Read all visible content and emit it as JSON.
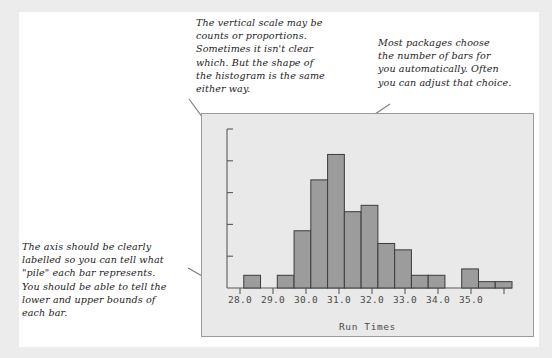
{
  "figure": {
    "background_color": "#ececed",
    "card_color": "#ffffff",
    "panel_color": "#e9e9e9"
  },
  "annotations": [
    {
      "name": "vertical-scale-note",
      "text": "The vertical scale may be\ncounts or proportions.\nSometimes it isn't clear\nwhich. But the shape of\nthe histogram is the same\neither way."
    },
    {
      "name": "number-of-bars-note",
      "text": "Most packages choose\nthe number of bars for\nyou automatically. Often\nyou can adjust that choice."
    },
    {
      "name": "axis-labelling-note",
      "text": "The axis should be clearly\nlabelled so you can tell what\n\"pile\" each bar represents.\nYou should be able to tell the\nlower and upper bounds of\neach bar."
    }
  ],
  "chart_data": {
    "type": "bar",
    "title": "",
    "xlabel": "Run Times",
    "ylabel": "",
    "xlim": [
      27.5,
      36.0
    ],
    "ylim": [
      0,
      25
    ],
    "grid": false,
    "legend": null,
    "bar_color": "#9c9c9c",
    "bar_edge_color": "#3c3c3c",
    "axis_color": "#5a5a5a",
    "xtick_labels": [
      "28.0",
      "29.0",
      "30.0",
      "31.0",
      "32.0",
      "33.0",
      "34.0",
      "35.0"
    ],
    "xtick_values": [
      28.0,
      29.0,
      30.0,
      31.0,
      32.0,
      33.0,
      34.0,
      35.0
    ],
    "ytick_values": [
      0,
      5,
      10,
      15,
      20,
      25
    ],
    "ytick_labels": [
      "",
      "",
      "",
      "",
      "",
      ""
    ],
    "bin_width": 0.5,
    "bin_edges": [
      27.5,
      28.0,
      28.5,
      29.0,
      29.5,
      30.0,
      30.5,
      31.0,
      31.5,
      32.0,
      32.5,
      33.0,
      33.5,
      34.0,
      34.5,
      35.0,
      35.5,
      36.0
    ],
    "categories": [
      "27.5",
      "28.0",
      "28.5",
      "29.0",
      "29.5",
      "30.0",
      "30.5",
      "31.0",
      "31.5",
      "32.0",
      "32.5",
      "33.0",
      "33.5",
      "34.0",
      "34.5",
      "35.0",
      "35.5"
    ],
    "values": [
      0,
      2,
      0,
      2,
      9,
      17,
      21,
      12,
      13,
      7,
      6,
      2,
      2,
      0,
      3,
      1,
      1
    ]
  }
}
